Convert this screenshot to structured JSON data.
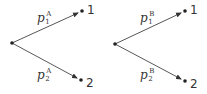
{
  "diagram": {
    "type": "probability-tree",
    "trees": [
      {
        "id": "A",
        "root": {
          "x": 12,
          "y": 43
        },
        "branches": [
          {
            "to_label": "1",
            "end": {
              "x": 82,
              "y": 11
            },
            "prob": {
              "base": "p",
              "sub": "1",
              "sup": "A"
            },
            "label_pos": {
              "x": 37,
              "y": 20
            }
          },
          {
            "to_label": "2",
            "end": {
              "x": 81,
              "y": 80
            },
            "prob": {
              "base": "p",
              "sub": "2",
              "sup": "A"
            },
            "label_pos": {
              "x": 37,
              "y": 77
            }
          }
        ]
      },
      {
        "id": "B",
        "root": {
          "x": 115,
          "y": 44
        },
        "branches": [
          {
            "to_label": "1",
            "end": {
              "x": 185,
              "y": 11
            },
            "prob": {
              "base": "p",
              "sub": "1",
              "sup": "B"
            },
            "label_pos": {
              "x": 140,
              "y": 20
            }
          },
          {
            "to_label": "2",
            "end": {
              "x": 185,
              "y": 81
            },
            "prob": {
              "base": "p",
              "sub": "2",
              "sup": "B"
            },
            "label_pos": {
              "x": 140,
              "y": 77
            }
          }
        ]
      }
    ]
  },
  "labels": {
    "treeA": {
      "p1": "p",
      "p1_sub": "1",
      "p1_sup": "A",
      "p2": "p",
      "p2_sub": "2",
      "p2_sup": "A",
      "n1": "1",
      "n2": "2"
    },
    "treeB": {
      "p1": "p",
      "p1_sub": "1",
      "p1_sup": "B",
      "p2": "p",
      "p2_sub": "2",
      "p2_sup": "B",
      "n1": "1",
      "n2": "2"
    }
  }
}
